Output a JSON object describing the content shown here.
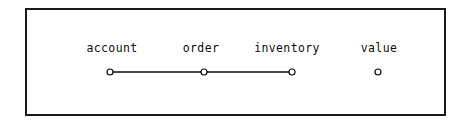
{
  "figure": {
    "background_color": "#ffffff",
    "frame": {
      "border_color": "#1a1a1a",
      "border_width": 2,
      "x": 25,
      "y": 8,
      "width": 421,
      "height": 108
    }
  },
  "chart_data": {
    "type": "scatter",
    "title": "",
    "subtitle": "",
    "xlabel": "",
    "ylabel": "",
    "grid": false,
    "legend": null,
    "axes_visible": false,
    "tick_labels": [],
    "marker_style": {
      "shape": "open-circle",
      "radius": 3,
      "edge_color": "#0d0d0d",
      "face_color": "#ffffff",
      "edge_width": 1.2
    },
    "line_style": {
      "color": "#0d0d0d",
      "width": 1.6,
      "dash": "solid"
    },
    "nodes": [
      {
        "label": "account",
        "x": 110,
        "y": 72,
        "label_x": 112,
        "label_y": 52,
        "connected": true
      },
      {
        "label": "order",
        "x": 204,
        "y": 72,
        "label_x": 201,
        "label_y": 52,
        "connected": true
      },
      {
        "label": "inventory",
        "x": 292,
        "y": 72,
        "label_x": 287,
        "label_y": 52,
        "connected": true
      },
      {
        "label": "value",
        "x": 378,
        "y": 72,
        "label_x": 379,
        "label_y": 52,
        "connected": false
      }
    ],
    "segments": [
      {
        "from": "account",
        "to": "order",
        "x1": 110,
        "y1": 72,
        "x2": 204,
        "y2": 72
      },
      {
        "from": "order",
        "to": "inventory",
        "x1": 204,
        "y1": 72,
        "x2": 292,
        "y2": 72
      }
    ],
    "labels": [
      "account",
      "order",
      "inventory",
      "value"
    ],
    "x": [
      110,
      204,
      292,
      378
    ],
    "values": [
      72,
      72,
      72,
      72
    ]
  }
}
